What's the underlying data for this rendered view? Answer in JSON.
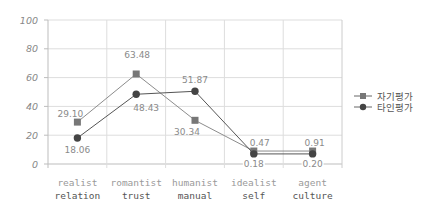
{
  "chart_data": {
    "type": "line",
    "title": "",
    "xlabel": "",
    "ylabel": "",
    "ylim": [
      0,
      100
    ],
    "yticks": [
      0,
      20,
      40,
      60,
      80,
      100
    ],
    "grid": true,
    "legend_position": "right",
    "categories": [
      {
        "line1": "realist",
        "line2": "relation"
      },
      {
        "line1": "romantist",
        "line2": "trust"
      },
      {
        "line1": "humanist",
        "line2": "manual"
      },
      {
        "line1": "idealist",
        "line2": "self"
      },
      {
        "line1": "agent",
        "line2": "culture"
      }
    ],
    "series": [
      {
        "name": "자기평가",
        "marker": "square",
        "color": "#777777",
        "values": [
          29.1,
          63.48,
          30.34,
          0.47,
          0.91
        ],
        "labels": [
          "29.10",
          "63.48",
          "30.34",
          "0.47",
          "0.91"
        ],
        "plot_values": [
          29.1,
          62.5,
          30.34,
          9,
          9
        ]
      },
      {
        "name": "타인평가",
        "marker": "circle",
        "color": "#444444",
        "values": [
          18.06,
          48.43,
          51.87,
          0.18,
          0.2
        ],
        "labels": [
          "18.06",
          "48.43",
          "51.87",
          "0.18",
          "0.20"
        ],
        "plot_values": [
          18.06,
          48.43,
          50.5,
          7,
          7
        ]
      }
    ]
  },
  "legend": {
    "items": [
      "자기평가",
      "타인평가"
    ]
  }
}
